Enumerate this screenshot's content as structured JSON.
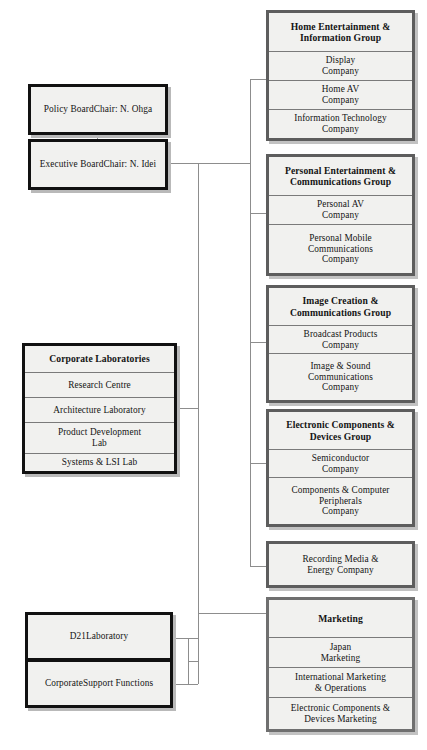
{
  "diagram": {
    "accent_dark": "#111111",
    "accent_gray": "#5d5d5d",
    "cell_fill": "#f1f1ef",
    "connector_color": "#8d8d8d"
  },
  "governance": {
    "policy_board": {
      "line1": "Policy Board",
      "line2": "Chair: N. Ohga"
    },
    "executive_board": {
      "line1": "Executive Board",
      "line2": "Chair: N. Idei"
    }
  },
  "corporate_laboratories": {
    "header": "Corporate Laboratories",
    "units": [
      "Research Centre",
      "Architecture Laboratory",
      "Product Development\nLab",
      "Systems & LSI Lab"
    ]
  },
  "d21_laboratory": {
    "line1": "D21",
    "line2": "Laboratory"
  },
  "corporate_support_functions": {
    "line1": "Corporate",
    "line2": "Support Functions"
  },
  "groups": [
    {
      "header": "Home Entertainment &\nInformation Group",
      "companies": [
        "Display\nCompany",
        "Home AV\nCompany",
        "Information Technology\nCompany"
      ]
    },
    {
      "header": "Personal Entertainment &\nCommunications Group",
      "companies": [
        "Personal AV\nCompany",
        "Personal Mobile\nCommunications\nCompany"
      ]
    },
    {
      "header": "Image Creation &\nCommunications Group",
      "companies": [
        "Broadcast Products\nCompany",
        "Image & Sound\nCommunications\nCompany"
      ]
    },
    {
      "header": "Electronic Components &\nDevices Group",
      "companies": [
        "Semiconductor\nCompany",
        "Components & Computer\nPeripherals\nCompany"
      ]
    }
  ],
  "recording_media": {
    "label": "Recording Media &\nEnergy Company"
  },
  "marketing": {
    "header": "Marketing",
    "units": [
      "Japan\nMarketing",
      "International Marketing\n& Operations",
      "Electronic Components &\nDevices Marketing"
    ]
  }
}
